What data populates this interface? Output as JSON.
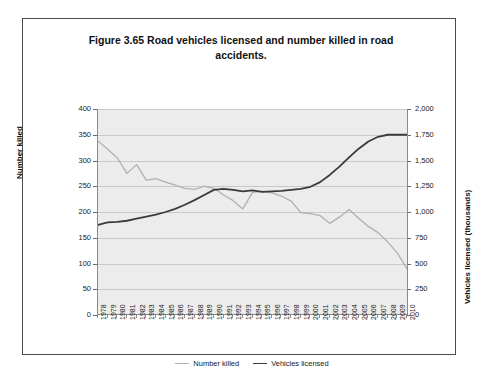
{
  "figure": {
    "label": "Figure 3.65",
    "title": "Figure 3.65   Road vehicles licensed and number killed in road accidents."
  },
  "axes": {
    "left_title": "Number killed",
    "right_title": "Vehicles licensed (thousands)",
    "left_ticks": [
      "400",
      "350",
      "300",
      "250",
      "200",
      "150",
      "100",
      "50",
      "0"
    ],
    "right_ticks": [
      "2,000",
      "1,750",
      "1,500",
      "1,250",
      "1,000",
      "750",
      "500",
      "250",
      "0"
    ]
  },
  "colors": {
    "number_killed": "#b0b0b0",
    "vehicles_licensed": "#3a3a3a",
    "plot_background": "#ececec",
    "gridline": "#c9c9c9",
    "frame": "#4a4a4a"
  },
  "legend": {
    "position": "bottom-center",
    "entries": [
      {
        "label": "Number killed",
        "color": "#b0b0b0"
      },
      {
        "label": "Vehicles licensed",
        "color": "#3a3a3a"
      }
    ]
  },
  "chart_data": {
    "type": "line",
    "title": "Figure 3.65   Road vehicles licensed and number killed in road accidents.",
    "xlabel": "",
    "ylabel": "Number killed",
    "y2label": "Vehicles licensed (thousands)",
    "ylim": [
      0,
      400
    ],
    "y2lim": [
      0,
      2000
    ],
    "grid": true,
    "legend_position": "bottom-center",
    "categories": [
      "1978",
      "1979",
      "1980",
      "1981",
      "1982",
      "1983",
      "1984",
      "1985",
      "1986",
      "1987",
      "1988",
      "1989",
      "1990",
      "1991",
      "1992",
      "1993",
      "1994",
      "1995",
      "1996",
      "1997",
      "1998",
      "1999",
      "2000",
      "2001",
      "2002",
      "2003",
      "2004",
      "2005",
      "2006",
      "2007",
      "2008",
      "2009",
      "2010"
    ],
    "series": [
      {
        "name": "Number killed",
        "axis": "left",
        "color": "#b0b0b0",
        "units": "deaths",
        "values": [
          338,
          322,
          305,
          275,
          292,
          262,
          265,
          258,
          252,
          246,
          244,
          250,
          246,
          233,
          222,
          206,
          238,
          240,
          237,
          231,
          221,
          199,
          197,
          193,
          178,
          190,
          205,
          188,
          172,
          160,
          142,
          120,
          90
        ]
      },
      {
        "name": "Vehicles licensed",
        "axis": "right",
        "color": "#3a3a3a",
        "units": "thousands",
        "values": [
          875,
          900,
          905,
          915,
          935,
          955,
          975,
          1000,
          1030,
          1070,
          1115,
          1165,
          1215,
          1225,
          1215,
          1200,
          1210,
          1195,
          1200,
          1205,
          1215,
          1225,
          1245,
          1290,
          1360,
          1440,
          1530,
          1615,
          1685,
          1730,
          1750,
          1750,
          1750
        ]
      }
    ]
  }
}
